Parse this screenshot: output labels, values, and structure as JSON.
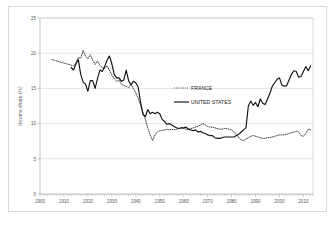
{
  "chart_data": {
    "type": "line",
    "title": "",
    "subtitle": "",
    "xlabel": "",
    "ylabel": "Income share (%)",
    "xlim": [
      1900,
      2014
    ],
    "ylim": [
      0,
      25
    ],
    "xticks": [
      1900,
      1910,
      1920,
      1930,
      1940,
      1950,
      1960,
      1970,
      1980,
      1990,
      2000,
      2010
    ],
    "yticks": [
      0,
      5,
      10,
      15,
      20,
      25
    ],
    "xtick_labels": [
      "1900",
      "1910",
      "1920",
      "1930",
      "1940",
      "1950",
      "1960",
      "1970",
      "1980",
      "1990",
      "2000",
      "2010"
    ],
    "ytick_labels": [
      "0",
      "5",
      "10",
      "15",
      "20",
      "25"
    ],
    "grid": true,
    "grid_axis": "y",
    "legend_position": "inside-center-right",
    "series": [
      {
        "name": "FRANCE",
        "style": "dotted",
        "color": "#222222",
        "x": [
          1905,
          1906,
          1907,
          1908,
          1909,
          1910,
          1911,
          1912,
          1913,
          1914,
          1915,
          1916,
          1917,
          1918,
          1919,
          1920,
          1921,
          1922,
          1923,
          1924,
          1925,
          1926,
          1927,
          1928,
          1929,
          1930,
          1931,
          1932,
          1933,
          1934,
          1935,
          1936,
          1937,
          1938,
          1939,
          1940,
          1941,
          1942,
          1943,
          1944,
          1945,
          1946,
          1947,
          1948,
          1949,
          1950,
          1951,
          1952,
          1953,
          1954,
          1955,
          1956,
          1957,
          1958,
          1959,
          1960,
          1961,
          1962,
          1963,
          1964,
          1965,
          1966,
          1967,
          1968,
          1969,
          1970,
          1971,
          1972,
          1973,
          1974,
          1975,
          1976,
          1977,
          1978,
          1979,
          1980,
          1981,
          1982,
          1983,
          1984,
          1985,
          1986,
          1987,
          1988,
          1989,
          1990,
          1991,
          1992,
          1993,
          1994,
          1995,
          1996,
          1997,
          1998,
          1999,
          2000,
          2001,
          2002,
          2003,
          2004,
          2005,
          2006,
          2007,
          2008,
          2009,
          2010,
          2011,
          2012,
          2013
        ],
        "values": [
          19.1,
          19.0,
          18.9,
          18.8,
          18.7,
          18.6,
          18.5,
          18.4,
          18.3,
          18.2,
          18.6,
          19.4,
          19.3,
          20.4,
          19.6,
          19.2,
          19.8,
          19.0,
          18.4,
          18.9,
          18.3,
          18.0,
          17.8,
          18.2,
          17.6,
          16.9,
          16.4,
          16.0,
          16.2,
          15.6,
          15.4,
          15.3,
          15.1,
          15.6,
          15.0,
          14.4,
          13.6,
          12.6,
          11.6,
          10.6,
          9.4,
          8.4,
          7.6,
          8.4,
          8.8,
          9.0,
          9.0,
          9.1,
          9.2,
          9.1,
          9.2,
          9.1,
          9.2,
          9.3,
          9.4,
          9.3,
          9.2,
          9.2,
          9.3,
          9.4,
          9.5,
          9.6,
          9.8,
          10.0,
          9.8,
          9.6,
          9.5,
          9.5,
          9.4,
          9.3,
          9.2,
          9.2,
          9.3,
          9.3,
          9.2,
          9.1,
          8.8,
          8.4,
          8.0,
          7.7,
          7.6,
          7.8,
          8.0,
          8.2,
          8.3,
          8.2,
          8.1,
          8.0,
          7.9,
          7.9,
          8.0,
          8.0,
          8.1,
          8.2,
          8.3,
          8.4,
          8.4,
          8.4,
          8.5,
          8.6,
          8.7,
          8.8,
          8.9,
          8.8,
          8.3,
          8.2,
          8.6,
          9.2,
          9.1
        ]
      },
      {
        "name": "UNITED STATES",
        "style": "solid",
        "color": "#111111",
        "x": [
          1913,
          1914,
          1915,
          1916,
          1917,
          1918,
          1919,
          1920,
          1921,
          1922,
          1923,
          1924,
          1925,
          1926,
          1927,
          1928,
          1929,
          1930,
          1931,
          1932,
          1933,
          1934,
          1935,
          1936,
          1937,
          1938,
          1939,
          1940,
          1941,
          1942,
          1943,
          1944,
          1945,
          1946,
          1947,
          1948,
          1949,
          1950,
          1951,
          1952,
          1953,
          1954,
          1955,
          1956,
          1957,
          1958,
          1959,
          1960,
          1961,
          1962,
          1963,
          1964,
          1965,
          1966,
          1967,
          1968,
          1969,
          1970,
          1971,
          1972,
          1973,
          1974,
          1975,
          1976,
          1977,
          1978,
          1979,
          1980,
          1981,
          1982,
          1983,
          1984,
          1985,
          1986,
          1987,
          1988,
          1989,
          1990,
          1991,
          1992,
          1993,
          1994,
          1995,
          1996,
          1997,
          1998,
          1999,
          2000,
          2001,
          2002,
          2003,
          2004,
          2005,
          2006,
          2007,
          2008,
          2009,
          2010,
          2011,
          2012,
          2013
        ],
        "values": [
          18.0,
          17.6,
          18.5,
          19.1,
          17.0,
          15.9,
          15.6,
          14.6,
          16.1,
          16.1,
          15.0,
          16.4,
          17.6,
          17.4,
          18.1,
          19.0,
          19.6,
          18.5,
          17.0,
          16.5,
          16.5,
          16.0,
          16.2,
          17.6,
          16.1,
          15.5,
          16.0,
          15.8,
          15.2,
          13.0,
          11.3,
          11.0,
          12.0,
          11.4,
          11.6,
          11.4,
          11.6,
          11.4,
          10.6,
          10.3,
          9.9,
          10.0,
          9.8,
          9.6,
          9.4,
          9.3,
          9.4,
          9.4,
          9.5,
          9.2,
          9.1,
          9.0,
          9.1,
          8.8,
          8.9,
          8.7,
          8.6,
          8.4,
          8.3,
          8.3,
          8.0,
          7.9,
          7.9,
          8.0,
          8.1,
          8.1,
          8.1,
          8.1,
          8.1,
          8.3,
          8.5,
          8.8,
          9.1,
          9.4,
          12.5,
          13.2,
          12.6,
          13.0,
          12.4,
          13.5,
          12.9,
          12.7,
          13.5,
          14.3,
          15.3,
          15.8,
          16.3,
          16.5,
          15.5,
          15.3,
          15.4,
          16.2,
          17.0,
          17.5,
          17.4,
          16.6,
          16.7,
          17.4,
          18.1,
          17.5,
          18.2
        ]
      }
    ]
  },
  "legend": {
    "items": [
      {
        "label": "FRANCE",
        "style": "dotted"
      },
      {
        "label": "UNITED STATES",
        "style": "solid"
      }
    ]
  },
  "axes": {
    "y_axis_title": "Income share (%)"
  }
}
